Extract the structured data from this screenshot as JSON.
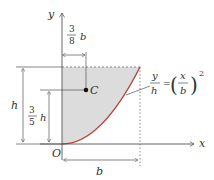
{
  "diagram": {
    "axes": {
      "x_label": "x",
      "y_label": "y",
      "origin_label": "O"
    },
    "centroid": {
      "label": "C",
      "x_fraction_of_b": "3/8",
      "y_fraction_of_h": "3/5"
    },
    "dimensions": {
      "top": {
        "num": "3",
        "den": "8",
        "var": "b"
      },
      "left_outer": {
        "var": "h"
      },
      "left_inner": {
        "num": "3",
        "den": "5",
        "var": "h"
      },
      "bottom": {
        "var": "b"
      }
    },
    "equation": {
      "lhs_num": "y",
      "lhs_den": "h",
      "eq": "=",
      "rhs_num": "x",
      "rhs_den": "b",
      "exponent": "2"
    },
    "colors": {
      "curve": "#b5443a",
      "fill": "#dcdcdc",
      "line": "#555555"
    }
  }
}
